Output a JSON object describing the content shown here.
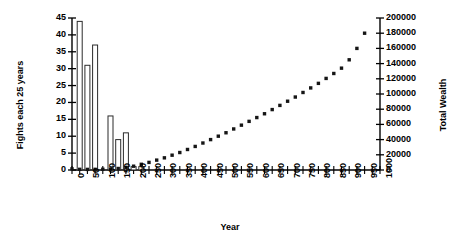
{
  "chart_data": {
    "type": "bar",
    "title": "",
    "xlabel": "Year",
    "ylabel": "Fights each 25 years",
    "y2label": "Total Wealth",
    "xlim": [
      0,
      1000
    ],
    "ylim": [
      0,
      45
    ],
    "y2lim": [
      0,
      200000
    ],
    "grid": false,
    "legend": "none",
    "x_tick_labels": [
      "0",
      "50",
      "100",
      "150",
      "200",
      "250",
      "300",
      "350",
      "400",
      "450",
      "500",
      "550",
      "600",
      "650",
      "700",
      "750",
      "800",
      "850",
      "900",
      "950",
      "1000"
    ],
    "x_tick_values": [
      0,
      50,
      100,
      150,
      200,
      250,
      300,
      350,
      400,
      450,
      500,
      550,
      600,
      650,
      700,
      750,
      800,
      850,
      900,
      950,
      1000
    ],
    "y_tick_labels": [
      "0",
      "5",
      "10",
      "15",
      "20",
      "25",
      "30",
      "35",
      "40",
      "45"
    ],
    "y_tick_values": [
      0,
      5,
      10,
      15,
      20,
      25,
      30,
      35,
      40,
      45
    ],
    "y2_tick_labels": [
      "0",
      "20000",
      "40000",
      "60000",
      "80000",
      "100000",
      "120000",
      "140000",
      "160000",
      "180000",
      "200000"
    ],
    "y2_tick_values": [
      0,
      20000,
      40000,
      60000,
      80000,
      100000,
      120000,
      140000,
      160000,
      180000,
      200000
    ],
    "x": [
      0,
      25,
      50,
      75,
      100,
      125,
      150,
      175,
      200,
      225,
      250,
      275,
      300,
      325,
      350,
      375,
      400,
      425,
      450,
      475,
      500,
      525,
      550,
      575,
      600,
      625,
      650,
      675,
      700,
      725,
      750,
      775,
      800,
      825,
      850,
      875,
      900,
      925,
      950
    ],
    "series": [
      {
        "name": "Fights each 25 years",
        "type": "bar",
        "axis": "left",
        "values": [
          0,
          44,
          31,
          37,
          0,
          16,
          9,
          11,
          1,
          1,
          0,
          0,
          0,
          0,
          0,
          0,
          0,
          0,
          0,
          0,
          0,
          0,
          0,
          0,
          0,
          0,
          0,
          0,
          0,
          0,
          0,
          0,
          0,
          0,
          0,
          0,
          0,
          0,
          0
        ]
      },
      {
        "name": "Total Wealth",
        "type": "scatter",
        "axis": "right",
        "values": [
          1500,
          900,
          800,
          900,
          1000,
          1200,
          2000,
          3500,
          5000,
          7500,
          10000,
          13000,
          16000,
          19500,
          23000,
          27000,
          31000,
          35500,
          40000,
          44500,
          49000,
          54000,
          59000,
          64000,
          69000,
          74000,
          79500,
          85000,
          90500,
          96000,
          102000,
          108000,
          114000,
          120500,
          127000,
          134000,
          145000,
          160000,
          180000
        ]
      }
    ]
  }
}
